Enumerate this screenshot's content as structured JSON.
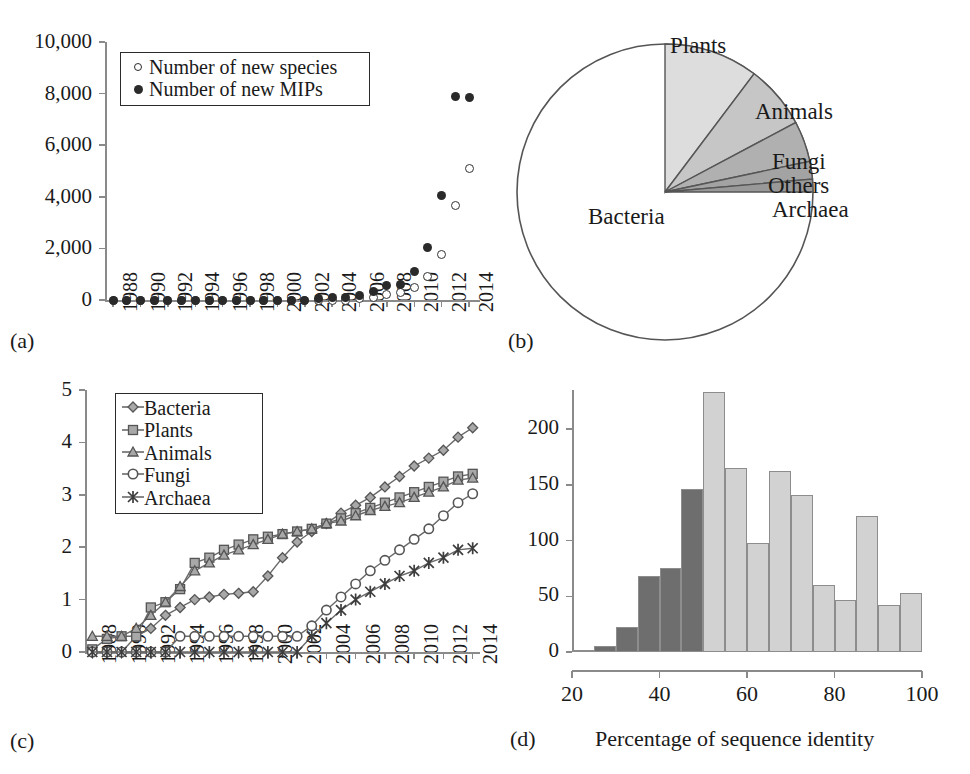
{
  "figure": {
    "panel_letters": [
      "(a)",
      "(b)",
      "(c)",
      "(d)"
    ]
  },
  "panel_a": {
    "letter": "(a)",
    "legend": [
      {
        "marker": "open-circle",
        "label": "Number of new species"
      },
      {
        "marker": "filled-circle",
        "label": "Number of new MIPs"
      }
    ],
    "yticks": [
      "0",
      "2,000",
      "4,000",
      "6,000",
      "8,000",
      "10,000"
    ],
    "xticks": [
      "1988",
      "1990",
      "1992",
      "1994",
      "1996",
      "1998",
      "2000",
      "2002",
      "2004",
      "2006",
      "2008",
      "2010",
      "2012",
      "2014"
    ]
  },
  "panel_b": {
    "letter": "(b)",
    "labels": {
      "plants": "Plants",
      "animals": "Animals",
      "fungi": "Fungi",
      "others": "Others",
      "archaea": "Archaea",
      "bacteria": "Bacteria"
    }
  },
  "panel_c": {
    "letter": "(c)",
    "legend": [
      {
        "marker": "diamond",
        "label": "Bacteria"
      },
      {
        "marker": "square",
        "label": "Plants"
      },
      {
        "marker": "triangle",
        "label": "Animals"
      },
      {
        "marker": "circle",
        "label": "Fungi"
      },
      {
        "marker": "star",
        "label": "Archaea"
      }
    ],
    "yticks": [
      "0",
      "1",
      "2",
      "3",
      "4",
      "5"
    ],
    "xticks": [
      "1988",
      "1990",
      "1992",
      "1994",
      "1996",
      "1998",
      "2000",
      "2002",
      "2004",
      "2006",
      "2008",
      "2010",
      "2012",
      "2014"
    ]
  },
  "panel_d": {
    "letter": "(d)",
    "xlabel": "Percentage of sequence identity",
    "yticks": [
      "0",
      "50",
      "100",
      "150",
      "200"
    ],
    "xticks": [
      "20",
      "40",
      "60",
      "80",
      "100"
    ]
  },
  "chart_data": [
    {
      "panel": "a",
      "type": "scatter",
      "title": "",
      "xlabel": "",
      "ylabel": "",
      "xlim": [
        1987.4,
        2014.8
      ],
      "ylim": [
        0,
        10000
      ],
      "yticks": [
        0,
        2000,
        4000,
        6000,
        8000,
        10000
      ],
      "xticks": [
        1988,
        1990,
        1992,
        1994,
        1996,
        1998,
        2000,
        2002,
        2004,
        2006,
        2008,
        2010,
        2012,
        2014
      ],
      "grid": false,
      "legend_position": "top-left-inside",
      "x": [
        1988,
        1989,
        1990,
        1991,
        1992,
        1993,
        1994,
        1995,
        1996,
        1997,
        1998,
        1999,
        2000,
        2001,
        2002,
        2003,
        2004,
        2005,
        2006,
        2007,
        2008,
        2009,
        2010,
        2011,
        2012,
        2013,
        2014
      ],
      "series": [
        {
          "name": "Number of new species",
          "marker": "open-circle",
          "values": [
            0,
            0,
            0,
            0,
            0,
            0,
            0,
            0,
            0,
            0,
            0,
            0,
            0,
            0,
            0,
            0,
            0,
            0,
            40,
            90,
            200,
            280,
            480,
            900,
            1750,
            3650,
            5100
          ]
        },
        {
          "name": "Number of new MIPs",
          "marker": "filled-circle",
          "values": [
            0,
            0,
            0,
            0,
            0,
            0,
            0,
            0,
            0,
            0,
            0,
            0,
            0,
            0,
            0,
            40,
            80,
            110,
            180,
            330,
            560,
            600,
            1100,
            2050,
            4050,
            7900,
            7850
          ]
        }
      ]
    },
    {
      "panel": "b",
      "type": "pie",
      "title": "",
      "start_angle_deg": 0,
      "direction": "clockwise",
      "labels": [
        "Plants",
        "Animals",
        "Fungi",
        "Others",
        "Archaea",
        "Bacteria"
      ],
      "values": [
        10.3,
        6.9,
        4.4,
        1.9,
        1.4,
        75.1
      ],
      "angles_deg": [
        37,
        25,
        16,
        7,
        5,
        270
      ],
      "colors": [
        "#dddddd",
        "#c6c6c6",
        "#b0b0b0",
        "#a3a3a3",
        "#999999",
        "#ffffff"
      ],
      "legend_position": "outside-callout"
    },
    {
      "panel": "c",
      "type": "line",
      "title": "",
      "xlabel": "",
      "ylabel": "",
      "xlim": [
        1987.5,
        2014.5
      ],
      "ylim": [
        0,
        5
      ],
      "yticks": [
        0,
        1,
        2,
        3,
        4,
        5
      ],
      "xticks": [
        1988,
        1990,
        1992,
        1994,
        1996,
        1998,
        2000,
        2002,
        2004,
        2006,
        2008,
        2010,
        2012,
        2014
      ],
      "grid": false,
      "legend_position": "top-left-inside",
      "x": [
        1988,
        1989,
        1990,
        1991,
        1992,
        1993,
        1994,
        1995,
        1996,
        1997,
        1998,
        1999,
        2000,
        2001,
        2002,
        2003,
        2004,
        2005,
        2006,
        2007,
        2008,
        2009,
        2010,
        2011,
        2012,
        2013,
        2014
      ],
      "series": [
        {
          "name": "Bacteria",
          "marker": "diamond",
          "values": [
            0.0,
            0.0,
            0.0,
            0.3,
            0.45,
            0.7,
            0.85,
            1.0,
            1.05,
            1.1,
            1.12,
            1.15,
            1.45,
            1.8,
            2.1,
            2.3,
            2.45,
            2.65,
            2.8,
            2.95,
            3.15,
            3.35,
            3.55,
            3.7,
            3.85,
            4.1,
            4.28
          ]
        },
        {
          "name": "Plants",
          "marker": "square",
          "values": [
            0.05,
            0.25,
            0.3,
            0.3,
            0.85,
            0.95,
            1.2,
            1.7,
            1.8,
            1.95,
            2.05,
            2.15,
            2.2,
            2.25,
            2.3,
            2.35,
            2.45,
            2.55,
            2.65,
            2.75,
            2.85,
            2.95,
            3.05,
            3.15,
            3.25,
            3.35,
            3.4
          ]
        },
        {
          "name": "Animals",
          "marker": "triangle",
          "values": [
            0.3,
            0.3,
            0.3,
            0.45,
            0.7,
            0.95,
            1.25,
            1.55,
            1.7,
            1.85,
            1.95,
            2.05,
            2.15,
            2.25,
            2.3,
            2.35,
            2.45,
            2.5,
            2.6,
            2.7,
            2.78,
            2.85,
            2.95,
            3.05,
            3.15,
            3.28,
            3.32
          ]
        },
        {
          "name": "Fungi",
          "marker": "circle",
          "values": [
            0.0,
            0.0,
            0.0,
            0.0,
            0.0,
            0.0,
            0.3,
            0.3,
            0.3,
            0.3,
            0.3,
            0.3,
            0.3,
            0.3,
            0.3,
            0.5,
            0.8,
            1.05,
            1.3,
            1.55,
            1.75,
            1.95,
            2.15,
            2.35,
            2.6,
            2.85,
            3.02
          ]
        },
        {
          "name": "Archaea",
          "marker": "star",
          "values": [
            0.0,
            0.0,
            0.0,
            0.0,
            0.0,
            0.0,
            0.0,
            0.0,
            0.0,
            0.0,
            0.0,
            0.0,
            0.0,
            0.0,
            0.0,
            0.3,
            0.55,
            0.8,
            1.0,
            1.15,
            1.3,
            1.45,
            1.55,
            1.7,
            1.8,
            1.95,
            1.98
          ]
        }
      ]
    },
    {
      "panel": "d",
      "type": "bar",
      "subtype": "histogram",
      "title": "",
      "xlabel": "Percentage of sequence identity",
      "ylabel": "",
      "xlim": [
        20,
        100
      ],
      "ylim": [
        0,
        235
      ],
      "yticks": [
        0,
        50,
        100,
        150,
        200
      ],
      "xticks": [
        20,
        40,
        60,
        80,
        100
      ],
      "grid": false,
      "bin_width": 5,
      "bin_starts": [
        20,
        25,
        30,
        35,
        40,
        45,
        50,
        55,
        60,
        65,
        70,
        75,
        80,
        85,
        90,
        95
      ],
      "categories": [
        "20-25",
        "25-30",
        "30-35",
        "35-40",
        "40-45",
        "45-50",
        "50-55",
        "55-60",
        "60-65",
        "65-70",
        "70-75",
        "75-80",
        "80-85",
        "85-90",
        "90-95",
        "95-100"
      ],
      "values": [
        2,
        5,
        22,
        68,
        75,
        146,
        233,
        165,
        98,
        162,
        141,
        60,
        47,
        122,
        42,
        53
      ],
      "bar_colors": [
        "#6e6e6e",
        "#6e6e6e",
        "#6e6e6e",
        "#6e6e6e",
        "#6e6e6e",
        "#6e6e6e",
        "#d2d2d2",
        "#d2d2d2",
        "#d2d2d2",
        "#d2d2d2",
        "#d2d2d2",
        "#d2d2d2",
        "#d2d2d2",
        "#d2d2d2",
        "#d2d2d2",
        "#d2d2d2"
      ],
      "color_groups": [
        {
          "name": "dark",
          "hex": "#6e6e6e",
          "range": [
            20,
            50
          ]
        },
        {
          "name": "light",
          "hex": "#d2d2d2",
          "range": [
            50,
            100
          ]
        }
      ]
    }
  ]
}
